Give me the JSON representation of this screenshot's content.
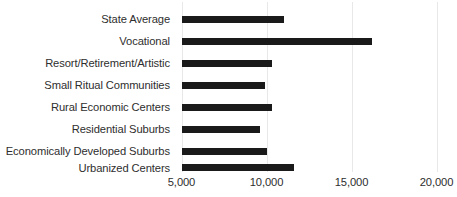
{
  "chart_data": {
    "type": "bar",
    "orientation": "horizontal",
    "title": "",
    "subtitle": "",
    "xlabel": "",
    "ylabel": "",
    "grid": true,
    "legend": false,
    "legend_position": "none",
    "bar_color": "#1a1a1a",
    "xlim": [
      5000,
      20000
    ],
    "x_base": 5000,
    "xticks": [
      5000,
      10000,
      15000,
      20000
    ],
    "xtick_labels": [
      "5,000",
      "10,000",
      "15,000",
      "20,000"
    ],
    "categories": [
      "State Average",
      "Vocational",
      "Resort/Retirement/Artistic",
      "Small Ritual Communities",
      "Rural Economic Centers",
      "Residential Suburbs",
      "Economically Developed Suburbs",
      "Urbanized Centers"
    ],
    "values": [
      11000,
      16200,
      10300,
      9900,
      10300,
      9600,
      10000,
      11600
    ],
    "series": [
      {
        "name": "",
        "values": [
          11000,
          16200,
          10300,
          9900,
          10300,
          9600,
          10000,
          11600
        ]
      }
    ]
  },
  "axis": {
    "ticks": [
      {
        "label": "5,000",
        "value": 5000
      },
      {
        "label": "10,000",
        "value": 10000
      },
      {
        "label": "15,000",
        "value": 15000
      },
      {
        "label": "20,000",
        "value": 20000
      }
    ]
  },
  "rows": [
    {
      "label": "State Average",
      "value": 11000
    },
    {
      "label": "Vocational",
      "value": 16200
    },
    {
      "label": "Resort/Retirement/Artistic",
      "value": 10300
    },
    {
      "label": "Small Ritual Communities",
      "value": 9900
    },
    {
      "label": "Rural Economic Centers",
      "value": 10300
    },
    {
      "label": "Residential Suburbs",
      "value": 9600
    },
    {
      "label": "Economically Developed Suburbs",
      "value": 10000
    },
    {
      "label": "Urbanized Centers",
      "value": 11600
    }
  ]
}
